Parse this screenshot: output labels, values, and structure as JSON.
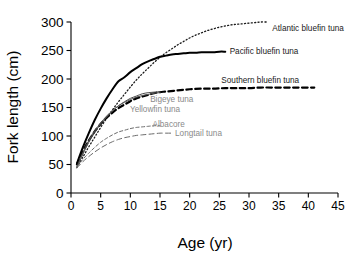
{
  "chart_data": {
    "type": "line",
    "title": "",
    "xlabel": "Age (yr)",
    "ylabel": "Fork length (cm)",
    "xlim": [
      0,
      45
    ],
    "ylim": [
      0,
      300
    ],
    "xticks": [
      0,
      5,
      10,
      15,
      20,
      25,
      30,
      35,
      40,
      45
    ],
    "yticks": [
      0,
      50,
      100,
      150,
      200,
      250,
      300
    ],
    "grid": false,
    "legend_position": "inline-annotations",
    "series": [
      {
        "name": "Atlantic bluefin tuna",
        "style": "dotted",
        "color": "#1a1a1a",
        "label_color": "#1a1a1a",
        "linewidth": 1.3,
        "label_x": 33.6,
        "label_y": 288,
        "x": [
          1,
          2,
          3,
          4,
          5,
          6,
          7,
          8,
          9,
          10,
          11,
          12,
          13,
          14,
          15,
          16,
          17,
          18,
          19,
          20,
          21,
          22,
          23,
          24,
          25,
          26,
          27,
          28,
          29,
          30,
          31,
          32,
          33
        ],
        "y": [
          45,
          63,
          81,
          98,
          115,
          131,
          146,
          160,
          173,
          186,
          198,
          209,
          219,
          229,
          238,
          246,
          253,
          260,
          266,
          272,
          277,
          281,
          285,
          288,
          291,
          293,
          295,
          296,
          297,
          298,
          299,
          300,
          300
        ]
      },
      {
        "name": "Pacific bluefin tuna",
        "style": "solid",
        "color": "#000000",
        "label_color": "#1a1a1a",
        "linewidth": 2.0,
        "label_x": 26.4,
        "label_y": 248,
        "x": [
          1,
          2,
          3,
          4,
          5,
          6,
          7,
          8,
          9,
          10,
          11,
          12,
          13,
          14,
          15,
          16,
          17,
          18,
          19,
          20,
          21,
          22,
          23,
          24,
          25,
          26
        ],
        "y": [
          52,
          80,
          105,
          128,
          148,
          166,
          182,
          196,
          203,
          212,
          219,
          226,
          231,
          235,
          239,
          241,
          243,
          244,
          245,
          246,
          246,
          247,
          247,
          247,
          248,
          248
        ]
      },
      {
        "name": "Southern bluefin tuna",
        "style": "dashed-bold",
        "color": "#000000",
        "label_color": "#1a1a1a",
        "linewidth": 2.2,
        "label_x": 25.0,
        "label_y": 196,
        "x": [
          1,
          2,
          3,
          4,
          5,
          6,
          7,
          8,
          9,
          10,
          11,
          12,
          13,
          14,
          15,
          16,
          18,
          20,
          22,
          24,
          26,
          28,
          30,
          32,
          34,
          36,
          38,
          40,
          41
        ],
        "y": [
          50,
          73,
          92,
          108,
          121,
          132,
          141,
          149,
          155,
          161,
          166,
          169,
          172,
          175,
          177,
          178,
          180,
          182,
          183,
          183,
          184,
          184,
          184,
          185,
          185,
          185,
          185,
          185,
          185
        ]
      },
      {
        "name": "Bigeye tuna",
        "style": "solid-thin",
        "color": "#4d4d4d",
        "label_color": "#8a8a8a",
        "linewidth": 1.0,
        "label_x": 13.0,
        "label_y": 163,
        "x": [
          1,
          2,
          3,
          4,
          5,
          6,
          7,
          8,
          9,
          10,
          11,
          12,
          13,
          14,
          15
        ],
        "y": [
          44,
          68,
          89,
          106,
          121,
          133,
          144,
          153,
          160,
          166,
          170,
          174,
          176,
          177,
          178
        ]
      },
      {
        "name": "Yellowfin tuna",
        "style": "solid-thin",
        "color": "#555555",
        "label_color": "#8a8a8a",
        "linewidth": 1.0,
        "label_x": 9.6,
        "label_y": 146,
        "x": [
          1,
          2,
          3,
          4,
          5,
          6,
          7,
          8,
          9,
          10,
          11,
          12,
          13,
          14,
          15
        ],
        "y": [
          46,
          71,
          92,
          109,
          123,
          135,
          145,
          153,
          159,
          164,
          168,
          171,
          173,
          175,
          176
        ]
      },
      {
        "name": "Albacore",
        "style": "dashed-short",
        "color": "#6b6b6b",
        "label_color": "#8a8a8a",
        "linewidth": 1.0,
        "label_x": 13.4,
        "label_y": 119,
        "x": [
          1,
          2,
          3,
          4,
          5,
          6,
          7,
          8,
          9,
          10,
          11,
          12,
          13,
          14,
          15
        ],
        "y": [
          46,
          59,
          70,
          80,
          89,
          96,
          102,
          107,
          110,
          113,
          115,
          116,
          117,
          118,
          118
        ]
      },
      {
        "name": "Longtail tuna",
        "style": "dashed-long",
        "color": "#6b6b6b",
        "label_color": "#8a8a8a",
        "linewidth": 1.0,
        "label_x": 17.2,
        "label_y": 104,
        "x": [
          1,
          2,
          3,
          4,
          5,
          6,
          7,
          8,
          9,
          10,
          11,
          12,
          13,
          14,
          15,
          16,
          17
        ],
        "y": [
          44,
          55,
          64,
          72,
          79,
          85,
          90,
          94,
          97,
          99,
          101,
          102,
          103,
          104,
          105,
          105,
          105
        ]
      }
    ]
  }
}
